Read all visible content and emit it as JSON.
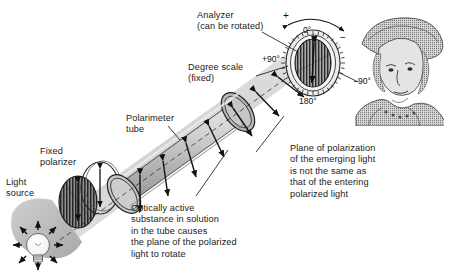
{
  "figure": {
    "background": "#ffffff"
  },
  "labels": {
    "analyzer": "Analyzer\n(can be rotated)",
    "degree_scale": "Degree scale\n(fixed)",
    "polarimeter_tube": "Polarimeter\ntube",
    "fixed_polarizer": "Fixed\npolarizer",
    "light_source": "Light\nsource",
    "optically_active": "Optically active\nsubstance in solution\nin the tube causes\nthe plane of the polarized\nlight to rotate",
    "plane_of_polarization": "Plane of polarization\nof the emerging light\nis not the same as\nthat of the entering\npolarized light"
  },
  "scale": {
    "zero": "0°",
    "plus_ninety": "+90°",
    "minus_ninety": "−90°",
    "one_eighty": "180°",
    "plus_sign": "+",
    "minus_sign": "−"
  },
  "colors": {
    "ink": "#1a1a1a",
    "beam": "#cfcfcf",
    "tube_light": "#dedede",
    "tube_mid": "#bdbdbd",
    "tube_dark": "#9a9a9a",
    "polarizer_dark": "#3a3a3a",
    "bulb": "#fdfdfd",
    "lamp_housing": "#b9b9b9",
    "portrait": "#6e6e6e"
  },
  "icons": {
    "bulb": "light-bulb-icon",
    "dial": "degree-dial-icon",
    "observer": "observer-portrait-icon"
  }
}
